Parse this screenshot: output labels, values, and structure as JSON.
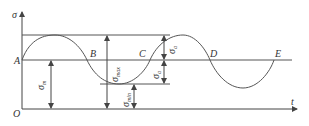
{
  "diagram": {
    "axes": {
      "y_label": "σ",
      "x_label": "t",
      "origin_label": "O"
    },
    "points": {
      "A": "A",
      "B": "B",
      "C": "C",
      "D": "D",
      "E": "E"
    },
    "dimensions": {
      "mean": {
        "symbol": "σ",
        "sub": "m"
      },
      "max": {
        "symbol": "σ",
        "sub": "max"
      },
      "min": {
        "symbol": "σ",
        "sub": "min"
      },
      "amp_upper": {
        "symbol": "σ",
        "sub": "a"
      },
      "amp_lower": {
        "symbol": "σ",
        "sub": "a"
      }
    },
    "colors": {
      "line": "#555555",
      "text": "#333333"
    }
  }
}
